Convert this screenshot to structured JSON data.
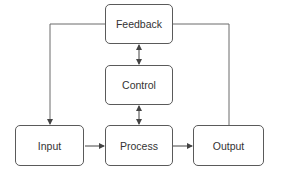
{
  "diagram": {
    "nodes": [
      {
        "id": "feedback",
        "label": "Feedback",
        "x": 105,
        "y": 4,
        "w": 68,
        "h": 40
      },
      {
        "id": "control",
        "label": "Control",
        "x": 105,
        "y": 65,
        "w": 68,
        "h": 40
      },
      {
        "id": "input",
        "label": "Input",
        "x": 15,
        "y": 125,
        "w": 69,
        "h": 41
      },
      {
        "id": "process",
        "label": "Process",
        "x": 105,
        "y": 125,
        "w": 68,
        "h": 41
      },
      {
        "id": "output",
        "label": "Output",
        "x": 193,
        "y": 125,
        "w": 71,
        "h": 41
      }
    ],
    "edges": [
      {
        "from": "feedback",
        "to": "input",
        "type": "arrow"
      },
      {
        "from": "output",
        "to": "feedback",
        "type": "line"
      },
      {
        "from": "feedback",
        "to": "control",
        "type": "bidirectional"
      },
      {
        "from": "control",
        "to": "process",
        "type": "bidirectional"
      },
      {
        "from": "input",
        "to": "process",
        "type": "arrow"
      },
      {
        "from": "process",
        "to": "output",
        "type": "arrow"
      }
    ],
    "colors": {
      "stroke": "#5a5a5a",
      "text": "#333333"
    }
  }
}
